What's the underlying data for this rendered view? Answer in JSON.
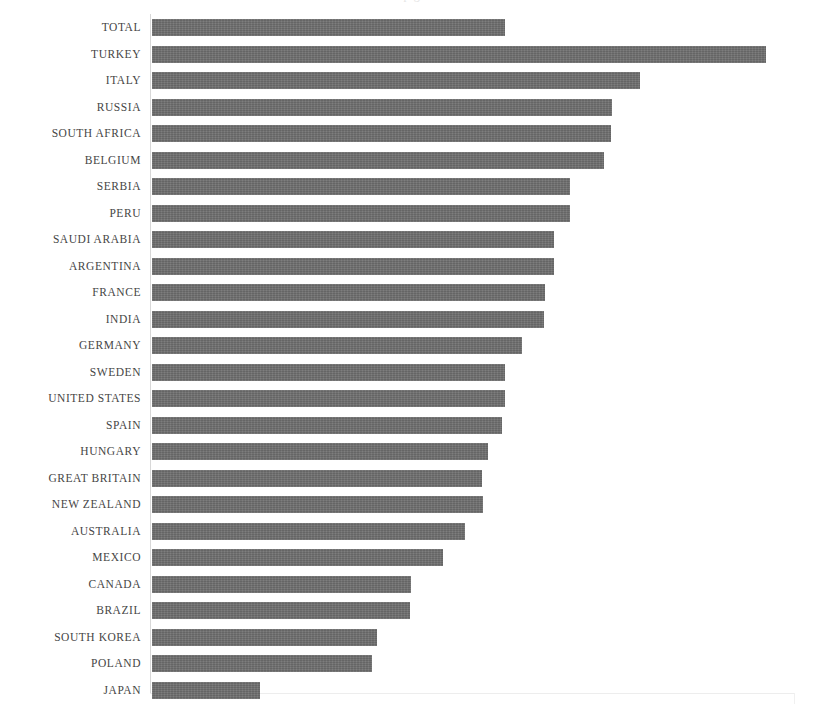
{
  "chart_data": {
    "type": "bar",
    "orientation": "horizontal",
    "title": "",
    "title_remnant": "p g",
    "xlabel": "",
    "ylabel": "",
    "grid": false,
    "legend": false,
    "axis_origin_px": 152,
    "max_value": 100,
    "xlim": [
      0,
      100
    ],
    "categories": [
      "TOTAL",
      "TURKEY",
      "ITALY",
      "RUSSIA",
      "SOUTH AFRICA",
      "BELGIUM",
      "SERBIA",
      "PERU",
      "SAUDI ARABIA",
      "ARGENTINA",
      "FRANCE",
      "INDIA",
      "GERMANY",
      "SWEDEN",
      "UNITED STATES",
      "SPAIN",
      "HUNGARY",
      "GREAT BRITAIN",
      "NEW ZEALAND",
      "AUSTRALIA",
      "MEXICO",
      "CANADA",
      "BRAZIL",
      "SOUTH KOREA",
      "POLAND",
      "JAPAN"
    ],
    "values": [
      57.5,
      100.0,
      79.4,
      74.9,
      74.8,
      73.6,
      68.1,
      68.1,
      65.5,
      65.5,
      64.0,
      63.8,
      60.3,
      57.5,
      57.5,
      57.0,
      54.7,
      53.7,
      53.9,
      51.0,
      47.4,
      42.2,
      42.0,
      36.6,
      35.8,
      17.6
    ],
    "bar_color": "#6f6f6f",
    "label_color": "#454545",
    "axis_color": "#d8d8d8",
    "background": "#ffffff"
  }
}
